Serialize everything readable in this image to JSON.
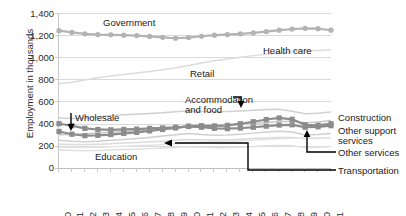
{
  "chart_data": {
    "type": "line",
    "title": "",
    "xlabel": "",
    "ylabel": "Employment in thousands",
    "ylim": [
      0,
      1400
    ],
    "yticks": [
      "0",
      "200",
      "400",
      "600",
      "800",
      "1,000",
      "1,200",
      "1,400"
    ],
    "ytick_values": [
      0,
      200,
      400,
      600,
      800,
      1000,
      1200,
      1400
    ],
    "grid": true,
    "legend_position": "inline-labels-and-right-callouts",
    "categories": [
      1990,
      1991,
      1992,
      1993,
      1994,
      1995,
      1996,
      1997,
      1998,
      1999,
      2000,
      2001,
      2002,
      2003,
      2004,
      2005,
      2006,
      2007,
      2008,
      2009,
      2010,
      2011
    ],
    "series": [
      {
        "name": "Government",
        "marker": "circle",
        "color": "#b3b3b3",
        "values": [
          1240,
          1225,
          1212,
          1205,
          1203,
          1200,
          1196,
          1188,
          1180,
          1172,
          1178,
          1190,
          1200,
          1205,
          1212,
          1220,
          1232,
          1245,
          1255,
          1262,
          1258,
          1245
        ]
      },
      {
        "name": "Health care",
        "marker": "none",
        "color": "#dcdcdc",
        "values": [
          760,
          775,
          795,
          815,
          832,
          845,
          858,
          872,
          888,
          905,
          925,
          948,
          968,
          985,
          1000,
          1015,
          1028,
          1040,
          1052,
          1058,
          1062,
          1068
        ]
      },
      {
        "name": "Retail",
        "marker": "none",
        "color": "#d0d0d0",
        "values": [
          452,
          448,
          452,
          462,
          472,
          480,
          486,
          492,
          498,
          508,
          518,
          512,
          508,
          510,
          515,
          522,
          528,
          530,
          512,
          490,
          495,
          505
        ]
      },
      {
        "name": "Accommodation and food",
        "marker": "none",
        "color": "#c8c8c8",
        "values": [
          300,
          302,
          308,
          316,
          324,
          330,
          336,
          342,
          350,
          360,
          370,
          372,
          376,
          382,
          392,
          402,
          412,
          420,
          420,
          408,
          415,
          428
        ]
      },
      {
        "name": "Wholesale",
        "marker": "square",
        "color": "#8c8c8c",
        "values": [
          400,
          382,
          358,
          348,
          345,
          348,
          352,
          358,
          362,
          368,
          375,
          368,
          358,
          355,
          360,
          368,
          378,
          388,
          390,
          368,
          372,
          382
        ]
      },
      {
        "name": "Construction",
        "marker": "square",
        "color": "#8c8c8c",
        "values": [
          330,
          305,
          292,
          295,
          302,
          312,
          322,
          335,
          348,
          362,
          378,
          382,
          380,
          385,
          400,
          418,
          438,
          452,
          440,
          390,
          385,
          400
        ]
      },
      {
        "name": "Other support services",
        "marker": "none",
        "color": "#cfcfcf",
        "values": [
          250,
          242,
          238,
          242,
          250,
          258,
          266,
          276,
          288,
          300,
          312,
          302,
          296,
          298,
          305,
          315,
          325,
          332,
          325,
          298,
          302,
          312
        ]
      },
      {
        "name": "Other services",
        "marker": "none",
        "color": "#dadada",
        "values": [
          215,
          212,
          212,
          215,
          220,
          225,
          230,
          236,
          242,
          250,
          258,
          256,
          254,
          256,
          260,
          266,
          272,
          276,
          275,
          265,
          268,
          274
        ]
      },
      {
        "name": "Transportation",
        "marker": "none",
        "color": "#e0e0e0",
        "values": [
          162,
          158,
          156,
          158,
          162,
          166,
          170,
          175,
          180,
          186,
          192,
          188,
          184,
          184,
          188,
          194,
          200,
          204,
          200,
          184,
          188,
          194
        ]
      },
      {
        "name": "Education",
        "marker": "none",
        "color": "#e4e4e4",
        "values": [
          188,
          186,
          186,
          188,
          192,
          196,
          200,
          206,
          212,
          220,
          228,
          232,
          236,
          240,
          246,
          252,
          258,
          264,
          268,
          268,
          270,
          274
        ]
      }
    ],
    "inline_labels": [
      {
        "text": "Government"
      },
      {
        "text": "Health care"
      },
      {
        "text": "Retail"
      },
      {
        "text": "Wholesale"
      },
      {
        "text": "Accommodation and food"
      },
      {
        "text": "Education"
      }
    ],
    "callout_labels": [
      {
        "text": "Construction"
      },
      {
        "text": "Other support services"
      },
      {
        "text": "Other services"
      },
      {
        "text": "Transportation"
      }
    ]
  }
}
